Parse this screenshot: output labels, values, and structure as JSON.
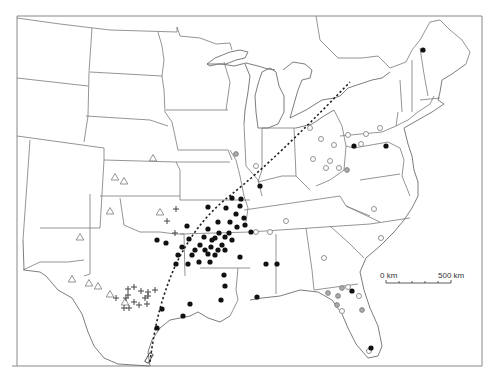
{
  "scale_bar": {
    "start_label": "0 km",
    "end_label": "500 km"
  },
  "markers": {
    "black_dots": [
      [
        423,
        50
      ],
      [
        354,
        146
      ],
      [
        386,
        146
      ],
      [
        260,
        186
      ],
      [
        232,
        198
      ],
      [
        241,
        199
      ],
      [
        226,
        208
      ],
      [
        236,
        214
      ],
      [
        240,
        206
      ],
      [
        208,
        207
      ],
      [
        229,
        233
      ],
      [
        230,
        222
      ],
      [
        245,
        225
      ],
      [
        251,
        232
      ],
      [
        240,
        257
      ],
      [
        215,
        238
      ],
      [
        222,
        245
      ],
      [
        200,
        245
      ],
      [
        204,
        237
      ],
      [
        208,
        229
      ],
      [
        219,
        233
      ],
      [
        225,
        237
      ],
      [
        232,
        240
      ],
      [
        212,
        240
      ],
      [
        205,
        250
      ],
      [
        195,
        250
      ],
      [
        189,
        239
      ],
      [
        182,
        247
      ],
      [
        178,
        255
      ],
      [
        176,
        264
      ],
      [
        188,
        264
      ],
      [
        192,
        255
      ],
      [
        215,
        255
      ],
      [
        211,
        247
      ],
      [
        218,
        250
      ],
      [
        225,
        250
      ],
      [
        210,
        262
      ],
      [
        199,
        262
      ],
      [
        208,
        254
      ],
      [
        187,
        226
      ],
      [
        157,
        240
      ],
      [
        166,
        243
      ],
      [
        237,
        227
      ],
      [
        244,
        218
      ],
      [
        218,
        222
      ],
      [
        266,
        264
      ],
      [
        277,
        264
      ],
      [
        224,
        275
      ],
      [
        225,
        286
      ],
      [
        221,
        300
      ],
      [
        190,
        304
      ],
      [
        183,
        316
      ],
      [
        162,
        309
      ],
      [
        157,
        328
      ],
      [
        257,
        297
      ],
      [
        352,
        291
      ],
      [
        371,
        348
      ]
    ],
    "gray_dots": [
      [
        347,
        170
      ],
      [
        236,
        154
      ],
      [
        342,
        288
      ],
      [
        328,
        293
      ],
      [
        338,
        296
      ],
      [
        337,
        305
      ],
      [
        362,
        310
      ]
    ],
    "open_dots": [
      [
        310,
        128
      ],
      [
        256,
        166
      ],
      [
        348,
        135
      ],
      [
        366,
        134
      ],
      [
        380,
        128
      ],
      [
        321,
        139
      ],
      [
        334,
        145
      ],
      [
        361,
        144
      ],
      [
        330,
        161
      ],
      [
        326,
        168
      ],
      [
        339,
        168
      ],
      [
        286,
        221
      ],
      [
        270,
        232
      ],
      [
        256,
        232
      ],
      [
        313,
        159
      ],
      [
        381,
        238
      ],
      [
        374,
        209
      ],
      [
        348,
        287
      ],
      [
        359,
        296
      ],
      [
        342,
        311
      ],
      [
        369,
        351
      ],
      [
        324,
        258
      ]
    ],
    "triangles": [
      [
        153,
        158
      ],
      [
        115,
        177
      ],
      [
        124,
        181
      ],
      [
        110,
        211
      ],
      [
        80,
        237
      ],
      [
        160,
        212
      ],
      [
        72,
        279
      ],
      [
        89,
        283
      ],
      [
        98,
        286
      ],
      [
        110,
        294
      ],
      [
        125,
        302
      ]
    ],
    "crosses": [
      [
        128,
        289
      ],
      [
        134,
        287
      ],
      [
        141,
        291
      ],
      [
        148,
        292
      ],
      [
        155,
        290
      ],
      [
        145,
        298
      ],
      [
        126,
        298
      ],
      [
        116,
        298
      ],
      [
        134,
        302
      ],
      [
        147,
        304
      ],
      [
        124,
        308
      ],
      [
        129,
        308
      ],
      [
        139,
        305
      ],
      [
        148,
        296
      ],
      [
        128,
        295
      ],
      [
        176,
        209
      ],
      [
        167,
        221
      ],
      [
        175,
        233
      ]
    ],
    "route_path": "M 150 360 C 155 330, 160 300, 175 265 C 190 235, 205 215, 230 195 C 260 170, 300 135, 348 82"
  }
}
